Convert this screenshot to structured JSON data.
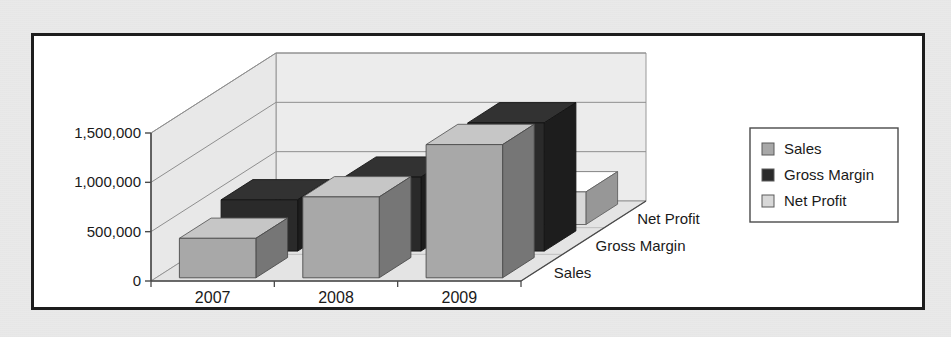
{
  "figure": {
    "background_color": "#e9e9e9",
    "plot_background_color": "#ffffff",
    "frame_color": "#1d1d1d"
  },
  "chart_data": {
    "type": "bar",
    "title": "",
    "subtitle": "",
    "xlabel": "",
    "ylabel": "",
    "zlabel": "",
    "projection": "3d",
    "grid": true,
    "gridlines_on": "y",
    "legend_position": "right",
    "categories": [
      "2007",
      "2008",
      "2009"
    ],
    "depth_categories": [
      "Sales",
      "Gross Margin",
      "Net Profit"
    ],
    "ylim": [
      0,
      1500000
    ],
    "yticks": [
      0,
      500000,
      1000000,
      1500000
    ],
    "ytick_labels": [
      "0",
      "500,000",
      "1,000,000",
      "1,500,000"
    ],
    "series": [
      {
        "name": "Sales",
        "color": "#a8a8a8",
        "values": [
          400000,
          820000,
          1350000
        ]
      },
      {
        "name": "Gross Margin",
        "color": "#2a2a2a",
        "values": [
          520000,
          750000,
          1300000
        ]
      },
      {
        "name": "Net Profit",
        "color": "#d8d8d8",
        "values": [
          140000,
          220000,
          330000
        ]
      }
    ]
  },
  "legend": {
    "border_color": "#4a4a4a",
    "items": [
      {
        "label": "Sales",
        "swatch_color": "#a8a8a8",
        "icon": "legend-swatch-icon"
      },
      {
        "label": "Gross Margin",
        "swatch_color": "#2a2a2a",
        "icon": "legend-swatch-icon"
      },
      {
        "label": "Net Profit",
        "swatch_color": "#d8d8d8",
        "icon": "legend-swatch-icon"
      }
    ]
  },
  "axes": {
    "y_tick_labels": [
      "1,500,000",
      "1,000,000",
      "500,000",
      "0"
    ],
    "x_tick_labels": [
      "2007",
      "2008",
      "2009"
    ],
    "z_tick_labels": [
      "Net Profit",
      "Gross Margin",
      "Sales"
    ]
  }
}
